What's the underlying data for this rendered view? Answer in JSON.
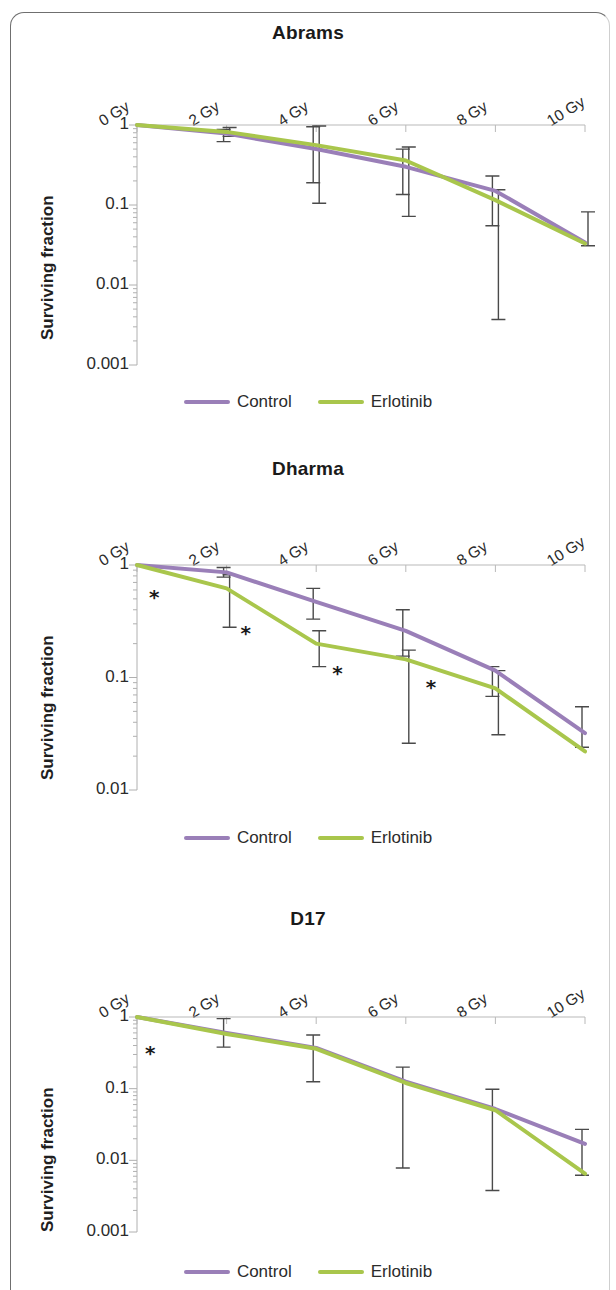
{
  "figure": {
    "ylabel": "Surviving fraction",
    "legend": [
      {
        "label": "Control",
        "color": "#9a7fb8"
      },
      {
        "label": "Erlotinib",
        "color": "#a9c64c"
      }
    ],
    "significance_marker": "*"
  },
  "chart_data": [
    {
      "type": "line",
      "title": "Abrams",
      "xlabel": "",
      "ylabel": "Surviving fraction",
      "yscale": "log",
      "ylim": [
        0.001,
        1
      ],
      "ytick_labels": [
        "1",
        "0.1",
        "0.01",
        "0.001"
      ],
      "ytick_values": [
        1,
        0.1,
        0.01,
        0.001
      ],
      "categories": [
        "0 Gy",
        "2 Gy",
        "4 Gy",
        "6 Gy",
        "8 Gy",
        "10 Gy"
      ],
      "x": [
        0,
        2,
        4,
        6,
        8,
        10
      ],
      "xlabel_unit": "Gy",
      "grid": false,
      "legend_position": "bottom",
      "axis_position": "top",
      "series": [
        {
          "name": "Control",
          "color": "#9a7fb8",
          "values": [
            1.0,
            0.78,
            0.5,
            0.3,
            0.15,
            0.034
          ],
          "err_low": [
            null,
            0.62,
            0.19,
            0.135,
            0.055,
            null
          ],
          "err_high": [
            null,
            0.88,
            0.95,
            0.5,
            0.23,
            null
          ]
        },
        {
          "name": "Erlotinib",
          "color": "#a9c64c",
          "values": [
            1.0,
            0.82,
            0.56,
            0.36,
            0.115,
            0.033
          ],
          "err_low": [
            null,
            0.72,
            0.105,
            0.072,
            0.0037,
            0.031
          ],
          "err_high": [
            null,
            0.93,
            0.97,
            0.53,
            0.155,
            0.082
          ]
        }
      ],
      "annotations": []
    },
    {
      "type": "line",
      "title": "Dharma",
      "xlabel": "",
      "ylabel": "Surviving fraction",
      "yscale": "log",
      "ylim": [
        0.01,
        1
      ],
      "ytick_labels": [
        "1",
        "0.1",
        "0.01"
      ],
      "ytick_values": [
        1,
        0.1,
        0.01
      ],
      "categories": [
        "0 Gy",
        "2 Gy",
        "4 Gy",
        "6 Gy",
        "8 Gy",
        "10 Gy"
      ],
      "x": [
        0,
        2,
        4,
        6,
        8,
        10
      ],
      "xlabel_unit": "Gy",
      "grid": false,
      "legend_position": "bottom",
      "axis_position": "top",
      "series": [
        {
          "name": "Control",
          "color": "#9a7fb8",
          "values": [
            1.0,
            0.86,
            0.47,
            0.26,
            0.115,
            0.032
          ],
          "err_low": [
            null,
            0.78,
            0.33,
            0.155,
            0.068,
            0.024
          ],
          "err_high": [
            null,
            0.95,
            0.62,
            0.4,
            0.125,
            0.055
          ]
        },
        {
          "name": "Erlotinib",
          "color": "#a9c64c",
          "values": [
            1.0,
            0.62,
            0.2,
            0.145,
            0.08,
            0.022
          ],
          "err_low": [
            null,
            0.28,
            0.125,
            0.026,
            0.031,
            null
          ],
          "err_high": [
            null,
            0.82,
            0.26,
            0.175,
            0.115,
            null
          ]
        }
      ],
      "annotations": [
        {
          "marker": "*",
          "at": "0 Gy"
        },
        {
          "marker": "*",
          "at": "2 Gy"
        },
        {
          "marker": "*",
          "at": "4 Gy"
        },
        {
          "marker": "*",
          "at": "6 Gy"
        }
      ]
    },
    {
      "type": "line",
      "title": "D17",
      "xlabel": "",
      "ylabel": "Surviving fraction",
      "yscale": "log",
      "ylim": [
        0.001,
        1
      ],
      "ytick_labels": [
        "1",
        "0.1",
        "0.01",
        "0.001"
      ],
      "ytick_values": [
        1,
        0.1,
        0.01,
        0.001
      ],
      "categories": [
        "0 Gy",
        "2 Gy",
        "4 Gy",
        "6 Gy",
        "8 Gy",
        "10 Gy"
      ],
      "x": [
        0,
        2,
        4,
        6,
        8,
        10
      ],
      "xlabel_unit": "Gy",
      "grid": false,
      "legend_position": "bottom",
      "axis_position": "top",
      "series": [
        {
          "name": "Control",
          "color": "#9a7fb8",
          "values": [
            1.0,
            0.6,
            0.37,
            0.125,
            0.052,
            0.017
          ],
          "err_low": [
            null,
            0.38,
            0.125,
            0.0078,
            0.0038,
            0.0062
          ],
          "err_high": [
            null,
            0.95,
            0.56,
            0.2,
            0.098,
            0.027
          ]
        },
        {
          "name": "Erlotinib",
          "color": "#a9c64c",
          "values": [
            1.0,
            0.58,
            0.36,
            0.12,
            0.05,
            0.0065
          ],
          "err_low": [
            null,
            null,
            null,
            null,
            null,
            null
          ],
          "err_high": [
            null,
            null,
            null,
            null,
            null,
            null
          ]
        }
      ],
      "annotations": [
        {
          "marker": "*",
          "at": "0 Gy"
        }
      ]
    }
  ]
}
